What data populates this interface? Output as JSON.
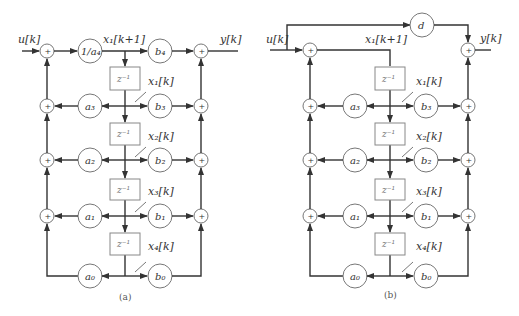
{
  "figure": {
    "panels": [
      {
        "id": "a",
        "caption": "(a)",
        "input_label": "u[k]",
        "output_label": "y[k]",
        "top_state_label": "x₁[k+1]",
        "lead_gain": "1/a₄",
        "feedback_gains": [
          "a₃",
          "a₂",
          "a₁",
          "a₀"
        ],
        "forward_gains": [
          "b₄",
          "b₃",
          "b₂",
          "b₁",
          "b₀"
        ],
        "delay_label": "z⁻¹",
        "state_labels": [
          "x₁[k]",
          "x₂[k]",
          "x₃[k]",
          "x₄[k]"
        ],
        "adder_symbol": "+"
      },
      {
        "id": "b",
        "caption": "(b)",
        "input_label": "u[k]",
        "output_label": "y[k]",
        "top_state_label": "x₁[k+1]",
        "direct_gain": "d",
        "feedback_gains": [
          "a₃",
          "a₂",
          "a₁",
          "a₀"
        ],
        "forward_gains": [
          "b₃",
          "b₂",
          "b₁",
          "b₀"
        ],
        "delay_label": "z⁻¹",
        "state_labels": [
          "x₁[k]",
          "x₂[k]",
          "x₃[k]",
          "x₄[k]"
        ],
        "adder_symbol": "+"
      }
    ]
  }
}
